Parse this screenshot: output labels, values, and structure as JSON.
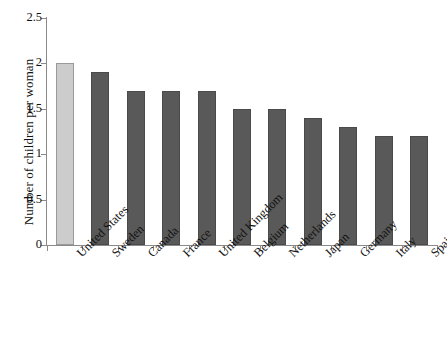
{
  "chart_data": {
    "type": "bar",
    "title": "",
    "xlabel": "",
    "ylabel": "Number of children per woman",
    "categories": [
      "United States",
      "Sweden",
      "Canada",
      "France",
      "United Kingdom",
      "Belgium",
      "Netherlands",
      "Japan",
      "Germany",
      "Italy",
      "Spain"
    ],
    "values": [
      2.0,
      1.9,
      1.7,
      1.7,
      1.7,
      1.5,
      1.5,
      1.4,
      1.3,
      1.2,
      1.2
    ],
    "ylim": [
      0,
      2.5
    ],
    "yticks": [
      "0",
      "0.5",
      "1",
      "1.5",
      "2",
      "2.5"
    ],
    "ytick_values": [
      0,
      0.5,
      1,
      1.5,
      2,
      2.5
    ],
    "grid": false,
    "legend": "none",
    "highlight_index": 0,
    "colors": {
      "bar": "#595959",
      "bar_border": "#4a4a4a",
      "highlight_bar": "#cccccc",
      "highlight_bar_border": "#9a9a9a",
      "axis": "#8a8a8a",
      "text": "#111111",
      "background": "#ffffff"
    }
  }
}
